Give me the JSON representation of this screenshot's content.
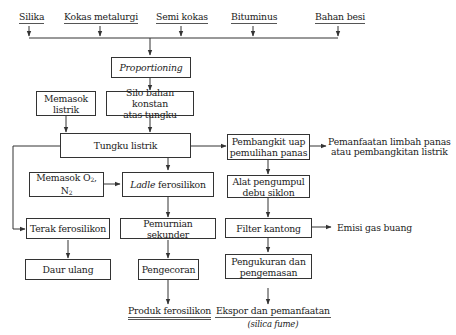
{
  "inputs": [
    {
      "id": "silika",
      "label": "Silika"
    },
    {
      "id": "kokas-metalurgi",
      "label": "Kokas metalurgi"
    },
    {
      "id": "semi-kokas",
      "label": "Semi kokas"
    },
    {
      "id": "bituminus",
      "label": "Bituminus"
    },
    {
      "id": "bahan-besi",
      "label": "Bahan besi"
    }
  ],
  "boxes": {
    "proportioning": "Proportioning",
    "memasok_listrik": "Memasok listrik",
    "silo_line1": "Silo bahan konstan",
    "silo_line2": "atas tungku",
    "tungku_listrik": "Tungku listrik",
    "memasok_o2n2_text": "Memasok O",
    "memasok_o2_sub": "2",
    "memasok_n2_text": ", N",
    "memasok_n2_sub": "2",
    "ladle_italic": "Ladle",
    "ladle_rest": " ferosilikon",
    "terak_ferosilikon": "Terak ferosilikon",
    "pemurnian_sekunder": "Pemurnian sekunder",
    "daur_ulang": "Daur ulang",
    "pengecoran": "Pengecoran",
    "pembangkit_line1": "Pembangkit uap",
    "pembangkit_line2": "pemulihan panas",
    "alat_line1": "Alat pengumpul",
    "alat_line2": "debu siklon",
    "filter_kantong": "Filter kantong",
    "pengukuran_line1": "Pengukuran dan",
    "pengukuran_line2": "pengemasan"
  },
  "outputs": {
    "pemanfaatan_line1": "Pemanfaatan limbah panas",
    "pemanfaatan_line2": "atau pembangkitan listrik",
    "emisi_gas_buang": "Emisi gas buang",
    "produk_ferosilikon": "Produk ferosilikon",
    "ekspor_numerator": "Ekspor dan pemanfaatan",
    "ekspor_denominator": "(silica fume)"
  },
  "colors": {
    "line": "#333333",
    "text": "#222222",
    "background": "#ffffff"
  }
}
